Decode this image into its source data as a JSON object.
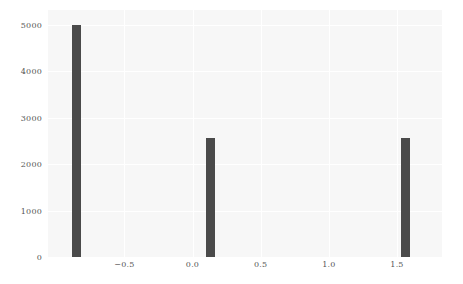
{
  "chart_data": {
    "type": "bar",
    "title": "",
    "xlabel": "",
    "ylabel": "",
    "xlim": [
      -1.06,
      1.83
    ],
    "ylim": [
      0,
      5320
    ],
    "grid": true,
    "legend": null,
    "bar_color": "#4a4a4a",
    "background_color": "#f7f7f7",
    "figure_color": "#ffffff",
    "x": [
      -0.85,
      0.13,
      1.56
    ],
    "values": [
      5000,
      2560,
      2560
    ],
    "bar_width": 0.065,
    "xticks": [
      {
        "value": -0.5,
        "label": "−0.5",
        "px": 119
      },
      {
        "value": 0.0,
        "label": "0.0",
        "px": 192
      },
      {
        "value": 0.5,
        "label": "0.5",
        "px": 265
      },
      {
        "value": 1.0,
        "label": "1.0",
        "px": 337
      },
      {
        "value": 1.5,
        "label": "1.5",
        "px": 409
      }
    ],
    "yticks": [
      {
        "value": 0,
        "label": "0"
      },
      {
        "value": 1000,
        "label": "1000"
      },
      {
        "value": 2000,
        "label": "2000"
      },
      {
        "value": 3000,
        "label": "3000"
      },
      {
        "value": 4000,
        "label": "4000"
      },
      {
        "value": 5000,
        "label": "5000"
      }
    ]
  }
}
